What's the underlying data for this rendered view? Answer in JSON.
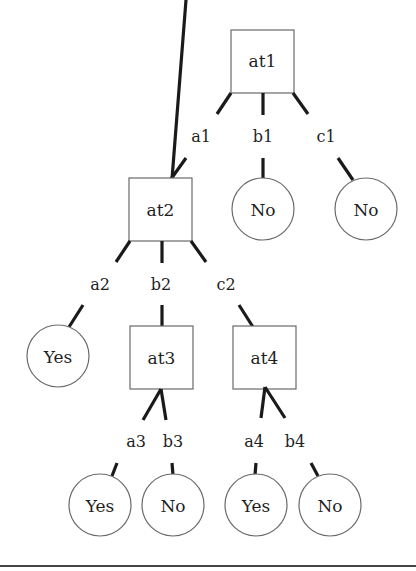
{
  "diagram": {
    "type": "decision-tree",
    "nodes": {
      "at1": {
        "label": "at1",
        "kind": "attribute"
      },
      "at2": {
        "label": "at2",
        "kind": "attribute"
      },
      "at3": {
        "label": "at3",
        "kind": "attribute"
      },
      "at4": {
        "label": "at4",
        "kind": "attribute"
      },
      "leaf_b1": {
        "label": "No",
        "kind": "leaf"
      },
      "leaf_c1": {
        "label": "No",
        "kind": "leaf"
      },
      "leaf_a2": {
        "label": "Yes",
        "kind": "leaf"
      },
      "leaf_a3": {
        "label": "Yes",
        "kind": "leaf"
      },
      "leaf_b3": {
        "label": "No",
        "kind": "leaf"
      },
      "leaf_a4": {
        "label": "Yes",
        "kind": "leaf"
      },
      "leaf_b4": {
        "label": "No",
        "kind": "leaf"
      }
    },
    "edges": {
      "a1": {
        "label": "a1",
        "from": "at1",
        "to": "at2"
      },
      "b1": {
        "label": "b1",
        "from": "at1",
        "to": "leaf_b1"
      },
      "c1": {
        "label": "c1",
        "from": "at1",
        "to": "leaf_c1"
      },
      "a2": {
        "label": "a2",
        "from": "at2",
        "to": "leaf_a2"
      },
      "b2": {
        "label": "b2",
        "from": "at2",
        "to": "at3"
      },
      "c2": {
        "label": "c2",
        "from": "at2",
        "to": "at4"
      },
      "a3": {
        "label": "a3",
        "from": "at3",
        "to": "leaf_a3"
      },
      "b3": {
        "label": "b3",
        "from": "at3",
        "to": "leaf_b3"
      },
      "a4": {
        "label": "a4",
        "from": "at4",
        "to": "leaf_a4"
      },
      "b4": {
        "label": "b4",
        "from": "at4",
        "to": "leaf_b4"
      }
    }
  }
}
